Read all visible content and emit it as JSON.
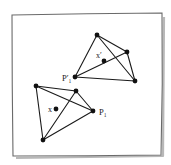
{
  "frame": {
    "stroke": "#6a6a6a",
    "shadow": "#b8b8b8",
    "corners": {
      "tl": [
        12,
        15
      ],
      "tr": [
        162,
        13
      ],
      "br": [
        161,
        155
      ],
      "bl": [
        13,
        156
      ]
    }
  },
  "tetrahedra": [
    {
      "id": "tetra-prime",
      "vertices": {
        "top": [
          97,
          35
        ],
        "right": [
          127,
          52
        ],
        "bottom_right": [
          135,
          81
        ],
        "p1": [
          75,
          77
        ]
      },
      "edges": [
        [
          "top",
          "right"
        ],
        [
          "top",
          "bottom_right"
        ],
        [
          "top",
          "p1"
        ],
        [
          "p1",
          "bottom_right"
        ],
        [
          "p1",
          "right"
        ],
        [
          "right",
          "bottom_right"
        ]
      ],
      "interior_point": {
        "label": "x′",
        "pos": [
          104,
          61
        ],
        "label_pos": [
          96,
          58
        ]
      },
      "vertex_label": {
        "vertex": "p1",
        "text": "P′₁",
        "label_pos": [
          62,
          81
        ]
      }
    },
    {
      "id": "tetra",
      "vertices": {
        "top_left": [
          36,
          86
        ],
        "top": [
          76,
          91
        ],
        "p1": [
          93,
          111
        ],
        "bottom": [
          43,
          140
        ]
      },
      "edges": [
        [
          "top_left",
          "top"
        ],
        [
          "top_left",
          "p1"
        ],
        [
          "top_left",
          "bottom"
        ],
        [
          "top",
          "p1"
        ],
        [
          "top",
          "bottom"
        ],
        [
          "bottom",
          "p1"
        ]
      ],
      "interior_point": {
        "label": "x",
        "pos": [
          56,
          109
        ],
        "label_pos": [
          48,
          112
        ]
      },
      "vertex_label": {
        "vertex": "p1",
        "text": "P₁",
        "label_pos": [
          99,
          115
        ]
      }
    }
  ],
  "style": {
    "edge_color": "#1a1a1a",
    "vertex_color": "#111111",
    "vertex_radius": 2.4,
    "point_radius": 2.4
  }
}
